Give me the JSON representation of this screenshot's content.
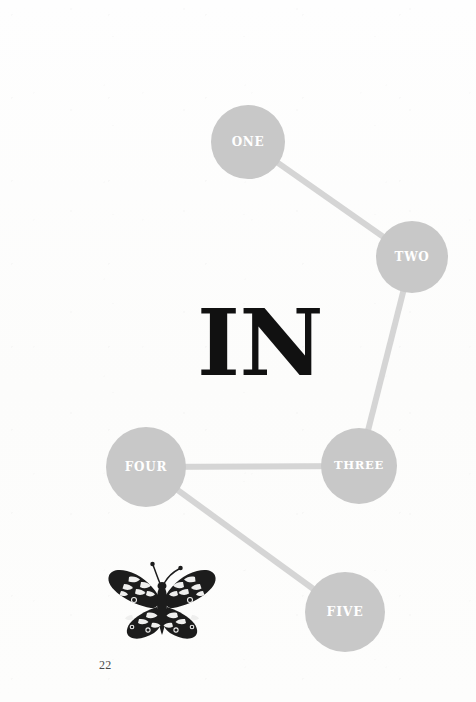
{
  "page": {
    "number": "22",
    "background_color": "#fdfdfc",
    "headline": "IN"
  },
  "colors": {
    "node_fill": "#c8c8c8",
    "edge_stroke": "#d5d5d5",
    "node_label": "#ffffff",
    "headline": "#111111",
    "page_number": "#4a4a4a"
  },
  "diagram": {
    "type": "node-link-graph",
    "nodes": [
      {
        "id": "one",
        "label": "ONE",
        "cx": 248,
        "cy": 142,
        "r": 37
      },
      {
        "id": "two",
        "label": "TWO",
        "cx": 412,
        "cy": 257,
        "r": 36
      },
      {
        "id": "three",
        "label": "THREE",
        "cx": 359,
        "cy": 466,
        "r": 38
      },
      {
        "id": "four",
        "label": "FOUR",
        "cx": 146,
        "cy": 467,
        "r": 40
      },
      {
        "id": "five",
        "label": "FIVE",
        "cx": 345,
        "cy": 612,
        "r": 40
      }
    ],
    "edges": [
      {
        "from": "one",
        "to": "two"
      },
      {
        "from": "two",
        "to": "three"
      },
      {
        "from": "three",
        "to": "four"
      },
      {
        "from": "four",
        "to": "five"
      }
    ]
  },
  "illustration": {
    "name": "butterfly-engraving",
    "description": "White admiral butterfly, dark wings with pale spots",
    "x": 99,
    "y": 560,
    "width": 126,
    "height": 88
  }
}
